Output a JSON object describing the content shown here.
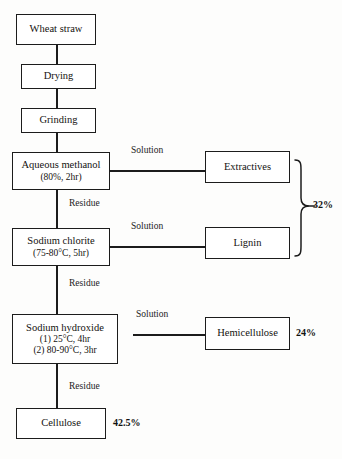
{
  "diagram": {
    "stroke_color": "#1c1c1c",
    "background_color": "#fdfdfc",
    "nodes": [
      {
        "id": "wheat-straw",
        "label": "Wheat straw",
        "sub1": "",
        "sub2": ""
      },
      {
        "id": "drying",
        "label": "Drying",
        "sub1": "",
        "sub2": ""
      },
      {
        "id": "grinding",
        "label": "Grinding",
        "sub1": "",
        "sub2": ""
      },
      {
        "id": "aqueous-methanol",
        "label": "Aqueous methanol",
        "sub1": "(80%, 2hr)",
        "sub2": ""
      },
      {
        "id": "sodium-chlorite",
        "label": "Sodium chlorite",
        "sub1": "(75-80°C, 5hr)",
        "sub2": ""
      },
      {
        "id": "sodium-hydroxide",
        "label": "Sodium hydroxide",
        "sub1": "(1) 25°C, 4hr",
        "sub2": "(2) 80-90°C, 3hr"
      },
      {
        "id": "extractives",
        "label": "Extractives",
        "sub1": "",
        "sub2": ""
      },
      {
        "id": "lignin",
        "label": "Lignin",
        "sub1": "",
        "sub2": ""
      },
      {
        "id": "hemicellulose",
        "label": "Hemicellulose",
        "sub1": "",
        "sub2": ""
      },
      {
        "id": "cellulose",
        "label": "Cellulose",
        "sub1": "",
        "sub2": ""
      }
    ],
    "edge_labels": {
      "solution_1": "Solution",
      "solution_2": "Solution",
      "solution_3": "Solution",
      "residue_1": "Residue",
      "residue_2": "Residue",
      "residue_3": "Residue"
    },
    "yields": {
      "extractives_lignin_combined": "32%",
      "hemicellulose": "24%",
      "cellulose": "42.5%"
    }
  }
}
